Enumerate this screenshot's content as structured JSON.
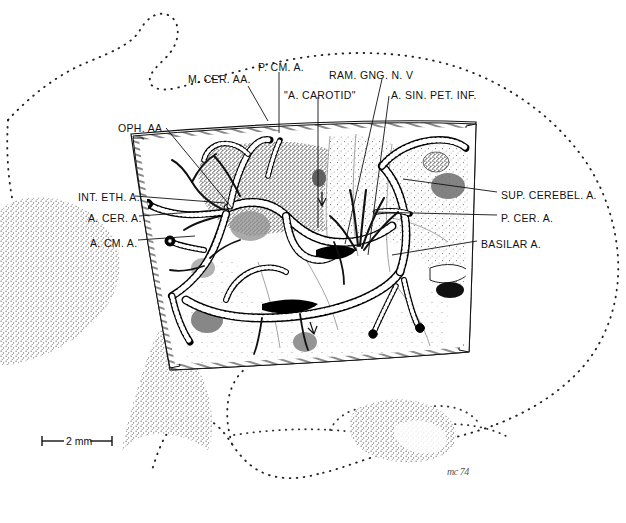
{
  "figure": {
    "domain": "anatomical-line-illustration",
    "background_color": "#ffffff",
    "ink_color": "#111111",
    "vessel_color": "#000000",
    "stipple_color": "#4a4a4a"
  },
  "labels": [
    {
      "id": "m-cer-aa",
      "text": "M. CER. AA.",
      "x": 188,
      "y": 74,
      "anchor": "start",
      "leader": [
        [
          248,
          86
        ],
        [
          268,
          121
        ]
      ]
    },
    {
      "id": "p-cm-a",
      "text": "P. CM. A.",
      "x": 258,
      "y": 62,
      "anchor": "start",
      "leader": [
        [
          279,
          72
        ],
        [
          279,
          133
        ]
      ]
    },
    {
      "id": "a-carotid",
      "text": "\"A. CAROTID\"",
      "x": 284,
      "y": 90,
      "anchor": "start",
      "leader": [
        [
          318,
          97
        ],
        [
          318,
          228
        ]
      ]
    },
    {
      "id": "ram-gng-n-v",
      "text": "RAM. GNG. N. V",
      "x": 329,
      "y": 70,
      "anchor": "start",
      "leader": [
        [
          382,
          79
        ],
        [
          345,
          244
        ]
      ]
    },
    {
      "id": "a-sin-pet-inf",
      "text": "A. SIN. PET. INF.",
      "x": 391,
      "y": 90,
      "anchor": "start",
      "leader": [
        [
          389,
          96
        ],
        [
          368,
          255
        ]
      ]
    },
    {
      "id": "oph-aa",
      "text": "OPH. AA.",
      "x": 118,
      "y": 123,
      "anchor": "start",
      "leader": [
        [
          166,
          128
        ],
        [
          232,
          208
        ]
      ]
    },
    {
      "id": "int-eth-a",
      "text": "INT. ETH. A.",
      "x": 78,
      "y": 192,
      "anchor": "start",
      "leader": [
        [
          135,
          196
        ],
        [
          225,
          203
        ]
      ]
    },
    {
      "id": "a-cer-a",
      "text": "A. CER. A.",
      "x": 88,
      "y": 213,
      "anchor": "start",
      "leader": [
        [
          139,
          216
        ],
        [
          208,
          211
        ]
      ]
    },
    {
      "id": "a-cm-a",
      "text": "A. CM. A.",
      "x": 90,
      "y": 238,
      "anchor": "start",
      "leader": [
        [
          138,
          240
        ],
        [
          195,
          236
        ]
      ]
    },
    {
      "id": "sup-cerebel-a",
      "text": "SUP. CEREBEL. A.",
      "x": 501,
      "y": 190,
      "anchor": "start",
      "leader": [
        [
          497,
          192
        ],
        [
          403,
          179
        ]
      ]
    },
    {
      "id": "p-cer-a",
      "text": "P. CER. A.",
      "x": 501,
      "y": 213,
      "anchor": "start",
      "leader": [
        [
          497,
          215
        ],
        [
          373,
          212
        ]
      ]
    },
    {
      "id": "basilar-a",
      "text": "BASILAR A.",
      "x": 481,
      "y": 239,
      "anchor": "start",
      "leader": [
        [
          477,
          241
        ],
        [
          392,
          255
        ]
      ]
    }
  ],
  "scale_bar": {
    "text": "2 mm",
    "x1": 42,
    "x2": 112,
    "y": 441,
    "units": "mm",
    "value": 2
  },
  "signature": {
    "text": "mc 74",
    "x": 447,
    "y": 466
  },
  "craniotomy_window": {
    "description": "Quadrilateral bone window with hatched cut-edge border, interior stippled brain surface",
    "corners": [
      [
        139,
        140
      ],
      [
        470,
        128
      ],
      [
        463,
        347
      ],
      [
        175,
        364
      ]
    ]
  },
  "vessel_groups": [
    {
      "name": "middle-cerebral-arteries",
      "label_ref": "m-cer-aa"
    },
    {
      "name": "posterior-communicating-artery",
      "label_ref": "p-cm-a"
    },
    {
      "name": "internal-carotid-artery",
      "label_ref": "a-carotid"
    },
    {
      "name": "ganglionic-ramus-trigeminal",
      "label_ref": "ram-gng-n-v"
    },
    {
      "name": "inferior-petrosal-sinus-artery",
      "label_ref": "a-sin-pet-inf"
    },
    {
      "name": "ophthalmic-arteries",
      "label_ref": "oph-aa"
    },
    {
      "name": "internal-ethmoidal-artery",
      "label_ref": "int-eth-a"
    },
    {
      "name": "cerebral-artery",
      "label_ref": "a-cer-a"
    },
    {
      "name": "cerebellar-medullary-artery",
      "label_ref": "a-cm-a"
    },
    {
      "name": "superior-cerebellar-artery",
      "label_ref": "sup-cerebel-a"
    },
    {
      "name": "posterior-cerebral-artery",
      "label_ref": "p-cer-a"
    },
    {
      "name": "basilar-artery",
      "label_ref": "basilar-a"
    }
  ]
}
